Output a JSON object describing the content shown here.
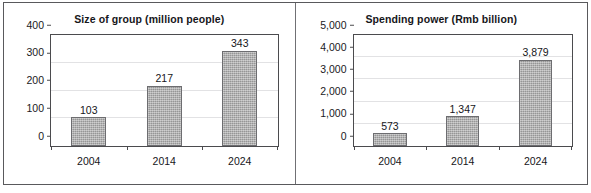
{
  "chart_data": [
    {
      "type": "bar",
      "title": "Size of group (million people)",
      "categories": [
        "2004",
        "2014",
        "2024"
      ],
      "values": [
        103,
        217,
        343
      ],
      "value_labels": [
        "103",
        "217",
        "343"
      ],
      "xlabel": "",
      "ylabel": "",
      "ylim": [
        0,
        400
      ],
      "yticks": [
        0,
        100,
        200,
        300,
        400
      ],
      "ytick_labels": [
        "0",
        "100",
        "200",
        "300",
        "400"
      ],
      "grid": true,
      "legend": false,
      "bar_color": "#a6a6a6",
      "bar_border_color": "#6d6d70"
    },
    {
      "type": "bar",
      "title": "Spending power (Rmb billion)",
      "categories": [
        "2004",
        "2014",
        "2024"
      ],
      "values": [
        573,
        1347,
        3879
      ],
      "value_labels": [
        "573",
        "1,347",
        "3,879"
      ],
      "xlabel": "",
      "ylabel": "",
      "ylim": [
        0,
        5000
      ],
      "yticks": [
        0,
        1000,
        2000,
        3000,
        4000,
        5000
      ],
      "ytick_labels": [
        "0",
        "1,000",
        "2,000",
        "3,000",
        "4,000",
        "5,000"
      ],
      "grid": true,
      "legend": false,
      "bar_color": "#a6a6a6",
      "bar_border_color": "#6d6d70"
    }
  ]
}
